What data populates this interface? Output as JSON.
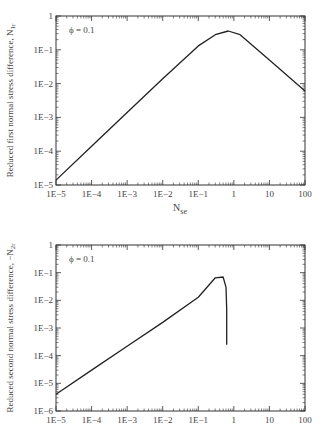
{
  "header_fragment": "y the ... ing up sp_se",
  "chart_data": [
    {
      "type": "line",
      "title": "",
      "annotation": "ϕ = 0.1",
      "xlabel": "N_se",
      "ylabel": "Reduced first normal stress difference, N_1r",
      "xscale": "log",
      "yscale": "log",
      "xlim": [
        1e-05,
        100
      ],
      "ylim": [
        1e-05,
        1
      ],
      "xticks": [
        "1E−5",
        "1E−4",
        "1E−3",
        "1E−2",
        "1E−1",
        "1",
        "10",
        "100"
      ],
      "yticks": [
        "1",
        "1E−1",
        "1E−2",
        "1E−3",
        "1E−4",
        "1E−5"
      ],
      "grid": false,
      "series": [
        {
          "name": "ϕ = 0.1",
          "x": [
            1e-05,
            0.0001,
            0.001,
            0.01,
            0.1,
            0.3,
            0.7,
            1.5,
            10,
            100
          ],
          "y": [
            1.4e-05,
            0.00014,
            0.0014,
            0.014,
            0.13,
            0.28,
            0.36,
            0.28,
            0.05,
            0.006
          ]
        }
      ]
    },
    {
      "type": "line",
      "title": "",
      "annotation": "ϕ = 0.1",
      "xlabel": "",
      "ylabel": "Reduced second normal stress difference, −N_2r",
      "xscale": "log",
      "yscale": "log",
      "xlim": [
        1e-05,
        100
      ],
      "ylim": [
        1e-06,
        1
      ],
      "xticks": [
        "1E−5",
        "1E−4",
        "1E−3",
        "1E−2",
        "1E−1",
        "1",
        "10",
        "100"
      ],
      "yticks": [
        "1",
        "1E−1",
        "1E−2",
        "1E−3",
        "1E−4",
        "1E−5",
        "1E−6"
      ],
      "grid": false,
      "series": [
        {
          "name": "ϕ = 0.1",
          "x": [
            1e-05,
            0.0001,
            0.001,
            0.01,
            0.1,
            0.3,
            0.5,
            0.6,
            0.63,
            0.63
          ],
          "y": [
            4e-06,
            3e-05,
            0.00022,
            0.0016,
            0.013,
            0.065,
            0.07,
            0.03,
            0.005,
            0.00025
          ]
        }
      ]
    }
  ],
  "labels": {
    "top_ylabel_main": "Reduced first normal stress difference, N",
    "top_ylabel_sub": "1r",
    "bottom_ylabel_main": "Reduced second normal stress difference, −N",
    "bottom_ylabel_sub": "2r",
    "xlabel_main": "N",
    "xlabel_sub": "se",
    "phi": "ϕ = 0.1"
  }
}
